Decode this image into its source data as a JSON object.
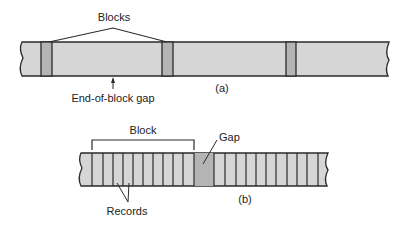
{
  "colors": {
    "tape_fill": "#d6d6d6",
    "gap_fill": "#b4b4b4",
    "stroke": "#2a2a2a",
    "text": "#222222"
  },
  "diagram_a": {
    "caption": "(a)",
    "top_label": "Blocks",
    "bottom_label": "End-of-block gap",
    "tape": {
      "x1": 22,
      "x2": 389,
      "y1": 42,
      "y2": 76
    },
    "gaps": [
      {
        "x1": 41,
        "x2": 52
      },
      {
        "x1": 162,
        "x2": 173
      },
      {
        "x1": 286,
        "x2": 296
      }
    ]
  },
  "diagram_b": {
    "caption": "(b)",
    "block_label": "Block",
    "gap_label": "Gap",
    "records_label": "Records",
    "tape": {
      "x1": 81,
      "x2": 328,
      "y1": 153,
      "y2": 186
    },
    "gap": {
      "x1": 194,
      "x2": 214
    },
    "record_lines": [
      92,
      103,
      113,
      123,
      133,
      143,
      153,
      163,
      173,
      183,
      194,
      214,
      225,
      236,
      246,
      256,
      266,
      276,
      287,
      297,
      307,
      318
    ]
  }
}
